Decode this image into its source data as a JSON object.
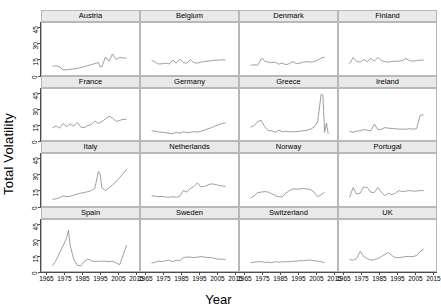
{
  "chart_data": {
    "type": "line",
    "title": "",
    "xlabel": "Year",
    "ylabel": "Total Volatility",
    "layout": {
      "rows": 4,
      "cols": 4,
      "style": "trellis-small-multiples",
      "grid": false,
      "legend": "none"
    },
    "xlim": [
      1962,
      2017
    ],
    "ylim": [
      0,
      50
    ],
    "xticks": [
      1965,
      1975,
      1985,
      1995,
      2005,
      2015
    ],
    "yticks": [
      0,
      15,
      30,
      45
    ],
    "line_color": "#808080",
    "strip_color": "#e9e9e9",
    "panels": [
      {
        "label": "Austria",
        "x": [
          1968,
          1970,
          1972,
          1974,
          1976,
          1978,
          1980,
          1982,
          1984,
          1986,
          1988,
          1990,
          1992,
          1994,
          1995,
          1996,
          1998,
          2000,
          2002,
          2004,
          2006,
          2008,
          2010
        ],
        "y": [
          8.0,
          8.4,
          7.5,
          4.4,
          4.6,
          5.0,
          5.4,
          6.0,
          6.8,
          7.6,
          8.6,
          9.6,
          10.6,
          11.6,
          7.2,
          8.0,
          17.0,
          13.0,
          20.0,
          14.5,
          16.5,
          16.0,
          16.0
        ]
      },
      {
        "label": "Belgium",
        "x": [
          1968,
          1970,
          1972,
          1974,
          1976,
          1978,
          1980,
          1982,
          1984,
          1986,
          1988,
          1990,
          1992,
          1994,
          1996,
          1998,
          2000,
          2002,
          2004,
          2006,
          2008,
          2010
        ],
        "y": [
          14.0,
          12.0,
          10.2,
          10.4,
          11.0,
          10.2,
          14.0,
          11.0,
          15.0,
          11.5,
          11.0,
          14.5,
          11.5,
          11.0,
          12.0,
          12.5,
          13.0,
          13.5,
          13.8,
          14.0,
          14.2,
          14.0
        ]
      },
      {
        "label": "Denmark",
        "x": [
          1968,
          1970,
          1972,
          1974,
          1975,
          1976,
          1978,
          1980,
          1982,
          1984,
          1986,
          1988,
          1990,
          1992,
          1994,
          1996,
          1998,
          2000,
          2002,
          2004,
          2006,
          2008,
          2010
        ],
        "y": [
          9.0,
          9.4,
          9.0,
          15.0,
          15.2,
          13.0,
          12.0,
          11.5,
          12.0,
          10.0,
          11.0,
          9.5,
          10.5,
          12.5,
          10.5,
          11.0,
          12.0,
          12.5,
          12.0,
          12.5,
          14.0,
          16.0,
          17.0
        ]
      },
      {
        "label": "Finland",
        "x": [
          1968,
          1970,
          1972,
          1974,
          1976,
          1978,
          1980,
          1982,
          1984,
          1986,
          1988,
          1990,
          1992,
          1994,
          1996,
          1998,
          2000,
          2002,
          2004,
          2006,
          2008,
          2010
        ],
        "y": [
          10.5,
          16.5,
          12.5,
          12.0,
          14.5,
          12.5,
          15.5,
          13.0,
          16.5,
          13.5,
          12.5,
          12.0,
          12.5,
          13.0,
          13.0,
          13.5,
          15.5,
          13.5,
          13.0,
          13.5,
          14.0,
          14.0
        ]
      },
      {
        "label": "France",
        "x": [
          1968,
          1970,
          1972,
          1974,
          1976,
          1978,
          1980,
          1982,
          1984,
          1986,
          1988,
          1990,
          1992,
          1994,
          1996,
          1998,
          2000,
          2002,
          2004,
          2006,
          2008,
          2010
        ],
        "y": [
          12.5,
          14.0,
          12.0,
          16.5,
          13.5,
          16.0,
          14.0,
          17.5,
          13.0,
          12.5,
          14.5,
          15.5,
          19.0,
          16.5,
          18.5,
          21.0,
          23.5,
          22.0,
          18.5,
          19.5,
          20.5,
          20.5
        ]
      },
      {
        "label": "Germany",
        "x": [
          1968,
          1970,
          1972,
          1974,
          1976,
          1978,
          1980,
          1982,
          1984,
          1986,
          1988,
          1990,
          1992,
          1994,
          1996,
          1998,
          2000,
          2002,
          2004,
          2006,
          2008,
          2010
        ],
        "y": [
          9.5,
          9.0,
          8.2,
          8.0,
          7.6,
          7.0,
          6.5,
          8.0,
          7.0,
          8.5,
          7.5,
          8.0,
          8.5,
          8.2,
          9.0,
          10.0,
          11.5,
          12.5,
          14.0,
          15.5,
          16.5,
          17.0
        ]
      },
      {
        "label": "Greece",
        "x": [
          1968,
          1970,
          1972,
          1974,
          1976,
          1978,
          1980,
          1982,
          1984,
          1986,
          1988,
          1990,
          1992,
          1994,
          1996,
          1998,
          2000,
          2002,
          2004,
          2006,
          2008,
          2009,
          2010,
          2011,
          2012
        ],
        "y": [
          13.0,
          14.5,
          18.5,
          19.5,
          13.5,
          9.5,
          9.5,
          8.0,
          10.0,
          8.5,
          9.0,
          8.5,
          8.5,
          8.5,
          9.0,
          9.5,
          10.0,
          11.0,
          13.0,
          18.0,
          45.0,
          44.0,
          8.0,
          17.0,
          6.5
        ]
      },
      {
        "label": "Ireland",
        "x": [
          1968,
          1970,
          1972,
          1974,
          1976,
          1978,
          1980,
          1982,
          1984,
          1986,
          1988,
          1990,
          1992,
          1994,
          1996,
          1998,
          2000,
          2002,
          2004,
          2006,
          2008,
          2010
        ],
        "y": [
          9.0,
          8.0,
          9.0,
          9.5,
          10.5,
          10.0,
          9.5,
          16.0,
          10.5,
          11.0,
          12.5,
          12.0,
          11.5,
          11.5,
          11.0,
          11.0,
          11.0,
          11.5,
          11.0,
          11.5,
          24.5,
          25.0
        ]
      },
      {
        "label": "Italy",
        "x": [
          1968,
          1970,
          1972,
          1974,
          1976,
          1978,
          1980,
          1982,
          1984,
          1986,
          1988,
          1990,
          1992,
          1994,
          1995,
          1996,
          1998,
          2000,
          2002,
          2004,
          2006,
          2008,
          2010
        ],
        "y": [
          6.0,
          6.5,
          7.5,
          9.5,
          8.5,
          9.0,
          10.0,
          11.0,
          12.0,
          12.5,
          13.5,
          14.5,
          17.0,
          33.0,
          30.0,
          17.0,
          14.5,
          17.0,
          20.0,
          23.0,
          27.0,
          31.0,
          35.0
        ]
      },
      {
        "label": "Netherlands",
        "x": [
          1968,
          1970,
          1972,
          1974,
          1976,
          1978,
          1980,
          1982,
          1984,
          1986,
          1988,
          1990,
          1992,
          1994,
          1996,
          1998,
          2000,
          2002,
          2004,
          2006,
          2008,
          2010
        ],
        "y": [
          9.5,
          9.0,
          8.5,
          8.8,
          8.2,
          8.0,
          8.5,
          8.0,
          9.0,
          14.5,
          13.0,
          16.5,
          18.5,
          22.0,
          18.0,
          18.5,
          20.0,
          21.0,
          20.5,
          19.5,
          19.0,
          18.5
        ]
      },
      {
        "label": "Norway",
        "x": [
          1968,
          1970,
          1972,
          1974,
          1976,
          1978,
          1980,
          1982,
          1984,
          1986,
          1988,
          1990,
          1992,
          1994,
          1996,
          1998,
          2000,
          2002,
          2004,
          2006,
          2008,
          2010
        ],
        "y": [
          7.0,
          9.5,
          12.5,
          13.0,
          13.5,
          13.0,
          11.5,
          9.5,
          8.5,
          8.5,
          12.0,
          14.5,
          16.0,
          16.0,
          16.0,
          16.5,
          16.0,
          15.5,
          13.0,
          8.5,
          10.5,
          13.0
        ]
      },
      {
        "label": "Portugal",
        "x": [
          1968,
          1970,
          1972,
          1974,
          1976,
          1978,
          1980,
          1982,
          1984,
          1986,
          1988,
          1990,
          1992,
          1994,
          1996,
          1998,
          2000,
          2002,
          2004,
          2006,
          2008,
          2010
        ],
        "y": [
          8.0,
          17.5,
          11.0,
          12.0,
          18.0,
          17.5,
          13.0,
          12.5,
          17.5,
          13.0,
          9.5,
          12.0,
          10.5,
          12.0,
          14.5,
          13.5,
          14.0,
          14.5,
          14.0,
          14.0,
          14.5,
          14.5
        ]
      },
      {
        "label": "Spain",
        "x": [
          1968,
          1970,
          1972,
          1974,
          1976,
          1977,
          1978,
          1980,
          1982,
          1984,
          1986,
          1988,
          1990,
          1992,
          1994,
          1996,
          1998,
          2000,
          2002,
          2004,
          2006,
          2008,
          2010
        ],
        "y": [
          5.5,
          11.0,
          18.0,
          25.0,
          33.0,
          40.0,
          25.0,
          12.0,
          6.0,
          5.5,
          10.0,
          12.0,
          10.5,
          9.5,
          10.0,
          10.0,
          10.0,
          9.5,
          10.0,
          8.5,
          6.5,
          16.0,
          25.5
        ]
      },
      {
        "label": "Sweden",
        "x": [
          1968,
          1970,
          1972,
          1974,
          1976,
          1978,
          1980,
          1982,
          1984,
          1986,
          1988,
          1990,
          1992,
          1994,
          1996,
          1998,
          2000,
          2002,
          2004,
          2006,
          2008,
          2010
        ],
        "y": [
          8.0,
          9.0,
          10.0,
          9.5,
          10.5,
          11.0,
          9.5,
          11.0,
          10.5,
          13.5,
          14.0,
          14.0,
          13.5,
          14.0,
          14.5,
          14.0,
          13.5,
          13.5,
          12.5,
          12.0,
          12.0,
          11.5
        ]
      },
      {
        "label": "Switzerland",
        "x": [
          1968,
          1970,
          1972,
          1974,
          1976,
          1978,
          1980,
          1982,
          1984,
          1986,
          1988,
          1990,
          1992,
          1994,
          1996,
          1998,
          2000,
          2002,
          2004,
          2006,
          2008,
          2010
        ],
        "y": [
          8.5,
          9.0,
          9.5,
          9.5,
          9.0,
          9.0,
          8.5,
          9.5,
          9.0,
          9.5,
          9.5,
          9.5,
          10.0,
          10.0,
          10.5,
          10.5,
          11.0,
          11.0,
          10.5,
          10.0,
          9.5,
          8.5
        ]
      },
      {
        "label": "UK",
        "x": [
          1968,
          1970,
          1972,
          1974,
          1976,
          1978,
          1980,
          1982,
          1984,
          1986,
          1988,
          1990,
          1992,
          1994,
          1996,
          1998,
          2000,
          2002,
          2004,
          2006,
          2008,
          2010
        ],
        "y": [
          11.5,
          11.0,
          12.5,
          19.5,
          14.5,
          12.5,
          11.0,
          11.5,
          12.5,
          14.5,
          16.5,
          18.5,
          15.5,
          13.5,
          13.5,
          14.0,
          14.5,
          14.5,
          14.5,
          15.5,
          19.5,
          21.5
        ]
      }
    ]
  }
}
